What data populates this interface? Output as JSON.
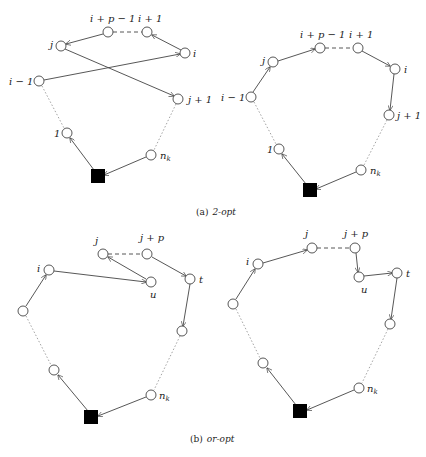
{
  "figure": {
    "panel_a": {
      "caption_prefix": "(a)",
      "caption_name": "2-opt",
      "before": {
        "labels": {
          "i_p_1": "i + p − 1",
          "i_plus_1": "i + 1",
          "j": "j",
          "i": "i",
          "i_minus_1": "i − 1",
          "j_plus_1": "j + 1",
          "one": "1",
          "nk": "n",
          "nk_sub": "k"
        }
      },
      "after": {
        "labels": {
          "i_p_1": "i + p − 1",
          "i_plus_1": "i + 1",
          "j": "j",
          "i": "i",
          "i_minus_1": "i − 1",
          "j_plus_1": "j + 1",
          "one": "1",
          "nk": "n",
          "nk_sub": "k"
        }
      }
    },
    "panel_b": {
      "caption_prefix": "(b)",
      "caption_name": "or-opt",
      "before": {
        "labels": {
          "j": "j",
          "j_p": "j + p",
          "i": "i",
          "u": "u",
          "t": "t",
          "nk": "n",
          "nk_sub": "k"
        }
      },
      "after": {
        "labels": {
          "j": "j",
          "j_p": "j + p",
          "i": "i",
          "u": "u",
          "t": "t",
          "nk": "n",
          "nk_sub": "k"
        }
      }
    }
  }
}
